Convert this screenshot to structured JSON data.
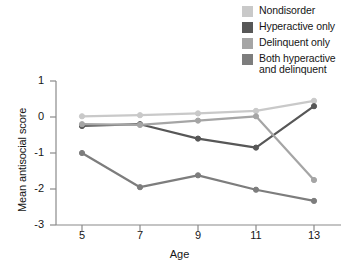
{
  "chart_data": {
    "type": "line",
    "title": "",
    "xlabel": "Age",
    "ylabel": "Mean antisocial score",
    "categories": [
      5,
      7,
      9,
      11,
      13
    ],
    "x_tick_labels": [
      "5",
      "7",
      "9",
      "11",
      "13"
    ],
    "y_tick_labels": [
      "1",
      "0",
      "-1",
      "-2",
      "-3"
    ],
    "y_ticks": [
      1,
      0,
      -1,
      -2,
      -3
    ],
    "xlim": [
      4,
      14
    ],
    "ylim": [
      -3,
      1
    ],
    "grid": false,
    "legend_position": "top-right",
    "markers": "circle",
    "series": [
      {
        "name": "Nondisorder",
        "color": "#c9c9c9",
        "values": [
          0.02,
          0.05,
          0.1,
          0.17,
          0.45
        ]
      },
      {
        "name": "Hyperactive only",
        "color": "#575757",
        "values": [
          -0.25,
          -0.2,
          -0.6,
          -0.85,
          0.3
        ]
      },
      {
        "name": "Delinquent only",
        "color": "#a5a5a5",
        "values": [
          -0.2,
          -0.22,
          -0.1,
          0.02,
          -1.75
        ]
      },
      {
        "name": "Both hyperactive and delinquent",
        "color": "#7d7d7d",
        "values": [
          -1.0,
          -1.95,
          -1.62,
          -2.02,
          -2.33
        ]
      }
    ]
  },
  "legend": {
    "items": [
      {
        "label": "Nondisorder",
        "color": "#c9c9c9"
      },
      {
        "label": "Hyperactive only",
        "color": "#575757"
      },
      {
        "label": "Delinquent only",
        "color": "#a5a5a5"
      },
      {
        "label": "Both hyperactive\nand delinquent",
        "color": "#7d7d7d"
      }
    ]
  },
  "axes": {
    "axis_color": "#8a8a8a",
    "text_color": "#161616"
  }
}
